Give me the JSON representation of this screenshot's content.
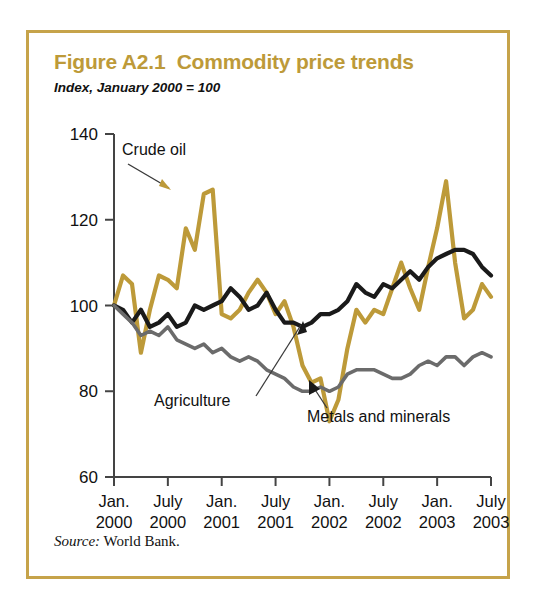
{
  "figure": {
    "title": "Figure A2.1  Commodity price trends",
    "subtitle": "Index, January 2000 = 100",
    "source": "World Bank.",
    "source_label": "Source:",
    "border_color": "#c6a34a",
    "title_color": "#bd9a39"
  },
  "chart_data": {
    "type": "line",
    "title": "Figure A2.1  Commodity price trends",
    "subtitle": "Index, January 2000 = 100",
    "xlabel": "",
    "ylabel": "",
    "ylim": [
      60,
      140
    ],
    "yticks": [
      60,
      80,
      100,
      120,
      140
    ],
    "ytick_labels": [
      "60",
      "80",
      "100",
      "120",
      "140"
    ],
    "grid": false,
    "legend_position": "inline-annotations",
    "xtick_labels": [
      {
        "month": "Jan.",
        "year": "2000"
      },
      {
        "month": "July",
        "year": "2000"
      },
      {
        "month": "Jan.",
        "year": "2001"
      },
      {
        "month": "July",
        "year": "2001"
      },
      {
        "month": "Jan.",
        "year": "2002"
      },
      {
        "month": "July",
        "year": "2002"
      },
      {
        "month": "Jan.",
        "year": "2003"
      },
      {
        "month": "July",
        "year": "2003"
      }
    ],
    "x": [
      "2000-01",
      "2000-02",
      "2000-03",
      "2000-04",
      "2000-05",
      "2000-06",
      "2000-07",
      "2000-08",
      "2000-09",
      "2000-10",
      "2000-11",
      "2000-12",
      "2001-01",
      "2001-02",
      "2001-03",
      "2001-04",
      "2001-05",
      "2001-06",
      "2001-07",
      "2001-08",
      "2001-09",
      "2001-10",
      "2001-11",
      "2001-12",
      "2002-01",
      "2002-02",
      "2002-03",
      "2002-04",
      "2002-05",
      "2002-06",
      "2002-07",
      "2002-08",
      "2002-09",
      "2002-10",
      "2002-11",
      "2002-12",
      "2003-01",
      "2003-02",
      "2003-03",
      "2003-04",
      "2003-05",
      "2003-06",
      "2003-07"
    ],
    "series": [
      {
        "name": "Crude oil",
        "color": "#bd9a39",
        "values": [
          100,
          107,
          105,
          89,
          99,
          107,
          106,
          104,
          118,
          113,
          126,
          127,
          98,
          97,
          99,
          103,
          106,
          103,
          98,
          101,
          95,
          86,
          82,
          83,
          73,
          78,
          90,
          99,
          96,
          99,
          98,
          104,
          110,
          104,
          99,
          109,
          118,
          129,
          110,
          97,
          99,
          105,
          102
        ]
      },
      {
        "name": "Agriculture",
        "color": "#1a1a1a",
        "values": [
          100,
          99,
          96,
          99,
          95,
          96,
          98,
          95,
          96,
          100,
          99,
          100,
          101,
          104,
          102,
          99,
          100,
          103,
          99,
          96,
          96,
          95,
          96,
          98,
          98,
          99,
          101,
          105,
          103,
          102,
          105,
          104,
          106,
          108,
          106,
          109,
          111,
          112,
          113,
          113,
          112,
          109,
          107
        ]
      },
      {
        "name": "Metals and minerals",
        "color": "#6b6b6b",
        "values": [
          100,
          98,
          96,
          93,
          94,
          93,
          95,
          92,
          91,
          90,
          91,
          89,
          90,
          88,
          87,
          88,
          87,
          85,
          84,
          83,
          81,
          80,
          80,
          81,
          80,
          81,
          84,
          85,
          85,
          85,
          84,
          83,
          83,
          84,
          86,
          87,
          86,
          88,
          88,
          86,
          88,
          89,
          88
        ]
      }
    ],
    "annotations": [
      {
        "text": "Crude oil",
        "target_series": "Crude oil"
      },
      {
        "text": "Agriculture",
        "target_series": "Agriculture"
      },
      {
        "text": "Metals and minerals",
        "target_series": "Metals and minerals"
      }
    ]
  }
}
